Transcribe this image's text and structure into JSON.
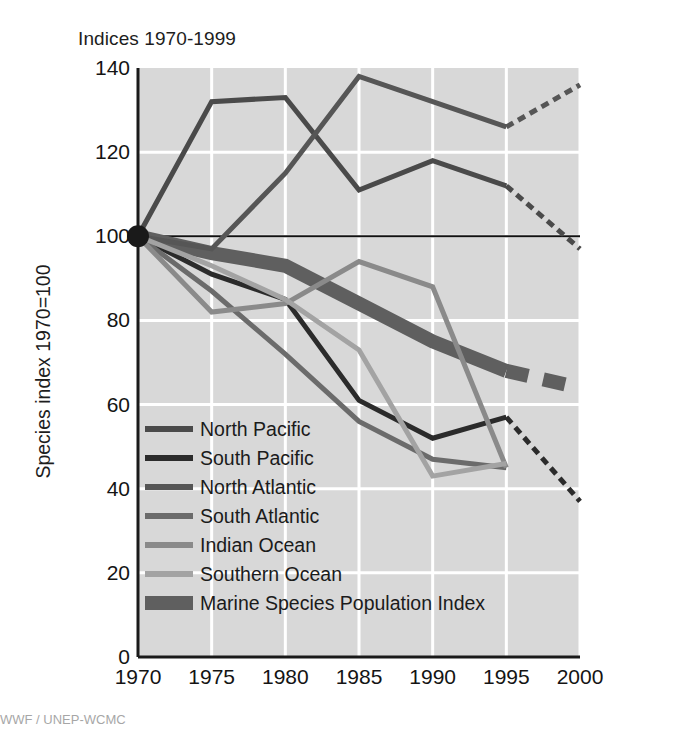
{
  "chart_data": {
    "type": "line",
    "title": "Indices 1970-1999",
    "xlabel": "",
    "ylabel": "Species index 1970=100",
    "xlim": [
      1970,
      2000
    ],
    "ylim": [
      0,
      140
    ],
    "ytick_labels": [
      "0",
      "20",
      "40",
      "60",
      "80",
      "100",
      "120",
      "140"
    ],
    "ytick_values": [
      0,
      20,
      40,
      60,
      80,
      100,
      120,
      140
    ],
    "xtick_labels": [
      "1970",
      "1975",
      "1980",
      "1985",
      "1990",
      "1995",
      "2000"
    ],
    "xtick_values": [
      1970,
      1975,
      1980,
      1985,
      1990,
      1995,
      2000
    ],
    "grid": true,
    "grid_color": "#ffffff",
    "plot_background": "#d8d8d8",
    "baseline_value": 100,
    "legend_position": "lower-left-inside",
    "x": [
      1970,
      1975,
      1980,
      1985,
      1990,
      1995
    ],
    "series": [
      {
        "name": "North Pacific",
        "color": "#4a4a4a",
        "width": 5,
        "values": [
          100,
          132,
          133,
          111,
          118,
          112
        ],
        "projection": {
          "x": [
            1995,
            2000
          ],
          "values": [
            112,
            97
          ],
          "style": "dashed"
        }
      },
      {
        "name": "South Pacific",
        "color": "#2b2b2b",
        "width": 5,
        "values": [
          100,
          91,
          85,
          61,
          52,
          57
        ],
        "projection": {
          "x": [
            1995,
            2000
          ],
          "values": [
            57,
            37
          ],
          "style": "dashed"
        }
      },
      {
        "name": "North Atlantic",
        "color": "#565656",
        "width": 5,
        "values": [
          100,
          97,
          115,
          138,
          132,
          126
        ],
        "projection": {
          "x": [
            1995,
            2000
          ],
          "values": [
            126,
            136
          ],
          "style": "dashed"
        }
      },
      {
        "name": "South Atlantic",
        "color": "#6b6b6b",
        "width": 5,
        "values": [
          100,
          87,
          72,
          56,
          47,
          45
        ],
        "projection": null
      },
      {
        "name": "Indian Ocean",
        "color": "#8a8a8a",
        "width": 5,
        "values": [
          100,
          82,
          84,
          94,
          88,
          45
        ],
        "projection": null
      },
      {
        "name": "Southern Ocean",
        "color": "#a3a3a3",
        "width": 5,
        "values": [
          100,
          93,
          85,
          73,
          43,
          46
        ],
        "projection": null
      },
      {
        "name": "Marine Species Population Index",
        "color": "#5f5f5f",
        "width": 14,
        "values": [
          100,
          96,
          93,
          84,
          75,
          68
        ],
        "projection": {
          "x": [
            1995,
            2000
          ],
          "values": [
            68,
            64
          ],
          "style": "dashed"
        }
      }
    ],
    "origin_marker": {
      "x": 1970,
      "y": 100,
      "radius": 11,
      "color": "#1a1a1a"
    },
    "legend": [
      {
        "label": "North Pacific",
        "color": "#4a4a4a",
        "thickness": 6
      },
      {
        "label": "South Pacific",
        "color": "#2b2b2b",
        "thickness": 6
      },
      {
        "label": "North Atlantic",
        "color": "#565656",
        "thickness": 6
      },
      {
        "label": "South Atlantic",
        "color": "#6b6b6b",
        "thickness": 6
      },
      {
        "label": "Indian Ocean",
        "color": "#8a8a8a",
        "thickness": 6
      },
      {
        "label": "Southern Ocean",
        "color": "#a3a3a3",
        "thickness": 6
      },
      {
        "label": "Marine Species Population Index",
        "color": "#5f5f5f",
        "thickness": 14
      }
    ]
  },
  "footer": {
    "text": "WWF / UNEP-WCMC"
  }
}
